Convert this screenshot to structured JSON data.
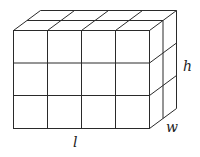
{
  "diagram": {
    "type": "rectangular-prism-of-unit-cubes",
    "grid": {
      "length_units": 4,
      "height_units": 3,
      "width_units": 2
    },
    "labels": {
      "length": "l",
      "height": "h",
      "width": "w"
    },
    "stroke_color": "#2a2a2a",
    "background": "#ffffff"
  }
}
